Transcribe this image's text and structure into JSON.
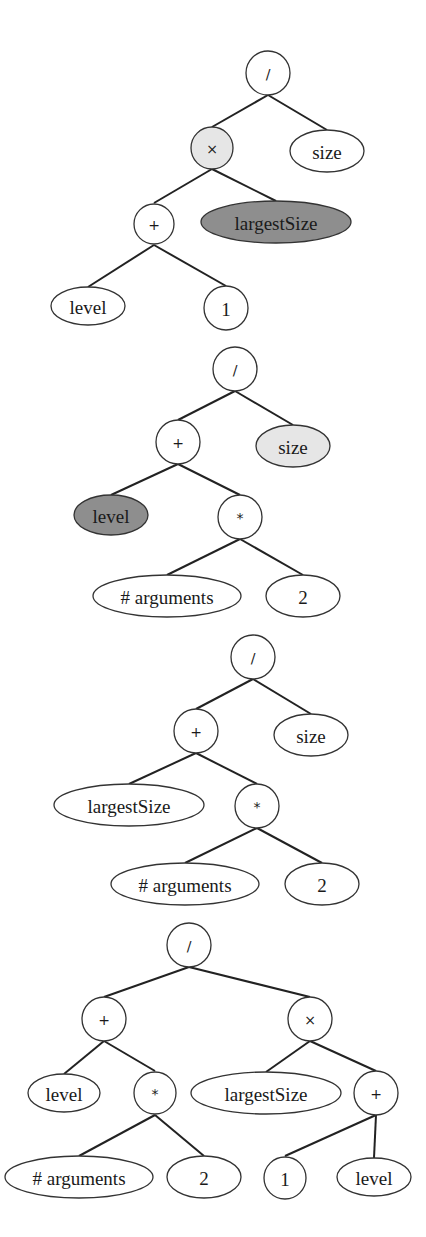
{
  "colors": {
    "none": "#ffffff",
    "light": "#e6e6e6",
    "dark": "#8e8e8e"
  },
  "trees": [
    {
      "name": "tree-1",
      "nodes": [
        {
          "id": "t1-div",
          "label": "/",
          "shape": "circle",
          "fill": "none"
        },
        {
          "id": "t1-times",
          "label": "×",
          "shape": "circle",
          "fill": "light"
        },
        {
          "id": "t1-size",
          "label": "size",
          "shape": "ellipse",
          "fill": "none"
        },
        {
          "id": "t1-plus",
          "label": "+",
          "shape": "circle",
          "fill": "none"
        },
        {
          "id": "t1-largestSize",
          "label": "largestSize",
          "shape": "ellipse",
          "fill": "dark"
        },
        {
          "id": "t1-level",
          "label": "level",
          "shape": "ellipse",
          "fill": "none"
        },
        {
          "id": "t1-one",
          "label": "1",
          "shape": "circle",
          "fill": "none"
        }
      ],
      "edges": [
        [
          "t1-div",
          "t1-times"
        ],
        [
          "t1-div",
          "t1-size"
        ],
        [
          "t1-times",
          "t1-plus"
        ],
        [
          "t1-times",
          "t1-largestSize"
        ],
        [
          "t1-plus",
          "t1-level"
        ],
        [
          "t1-plus",
          "t1-one"
        ]
      ]
    },
    {
      "name": "tree-2",
      "nodes": [
        {
          "id": "t2-div",
          "label": "/",
          "shape": "circle",
          "fill": "none"
        },
        {
          "id": "t2-plus",
          "label": "+",
          "shape": "circle",
          "fill": "none"
        },
        {
          "id": "t2-size",
          "label": "size",
          "shape": "ellipse",
          "fill": "light"
        },
        {
          "id": "t2-level",
          "label": "level",
          "shape": "ellipse",
          "fill": "dark"
        },
        {
          "id": "t2-mul",
          "label": "*",
          "shape": "circle",
          "fill": "none"
        },
        {
          "id": "t2-args",
          "label": "# arguments",
          "shape": "ellipse",
          "fill": "none"
        },
        {
          "id": "t2-two",
          "label": "2",
          "shape": "ellipse",
          "fill": "none"
        }
      ],
      "edges": [
        [
          "t2-div",
          "t2-plus"
        ],
        [
          "t2-div",
          "t2-size"
        ],
        [
          "t2-plus",
          "t2-level"
        ],
        [
          "t2-plus",
          "t2-mul"
        ],
        [
          "t2-mul",
          "t2-args"
        ],
        [
          "t2-mul",
          "t2-two"
        ]
      ]
    },
    {
      "name": "tree-3",
      "nodes": [
        {
          "id": "t3-div",
          "label": "/",
          "shape": "circle",
          "fill": "none"
        },
        {
          "id": "t3-plus",
          "label": "+",
          "shape": "circle",
          "fill": "none"
        },
        {
          "id": "t3-size",
          "label": "size",
          "shape": "ellipse",
          "fill": "none"
        },
        {
          "id": "t3-largestSize",
          "label": "largestSize",
          "shape": "ellipse",
          "fill": "none"
        },
        {
          "id": "t3-mul",
          "label": "*",
          "shape": "circle",
          "fill": "none"
        },
        {
          "id": "t3-args",
          "label": "# arguments",
          "shape": "ellipse",
          "fill": "none"
        },
        {
          "id": "t3-two",
          "label": "2",
          "shape": "ellipse",
          "fill": "none"
        }
      ],
      "edges": [
        [
          "t3-div",
          "t3-plus"
        ],
        [
          "t3-div",
          "t3-size"
        ],
        [
          "t3-plus",
          "t3-largestSize"
        ],
        [
          "t3-plus",
          "t3-mul"
        ],
        [
          "t3-mul",
          "t3-args"
        ],
        [
          "t3-mul",
          "t3-two"
        ]
      ]
    },
    {
      "name": "tree-4",
      "nodes": [
        {
          "id": "t4-div",
          "label": "/",
          "shape": "circle",
          "fill": "none"
        },
        {
          "id": "t4-plus",
          "label": "+",
          "shape": "circle",
          "fill": "none"
        },
        {
          "id": "t4-times",
          "label": "×",
          "shape": "circle",
          "fill": "none"
        },
        {
          "id": "t4-level",
          "label": "level",
          "shape": "ellipse",
          "fill": "none"
        },
        {
          "id": "t4-mul",
          "label": "*",
          "shape": "circle",
          "fill": "none"
        },
        {
          "id": "t4-largestSize",
          "label": "largestSize",
          "shape": "ellipse",
          "fill": "none"
        },
        {
          "id": "t4-plus2",
          "label": "+",
          "shape": "circle",
          "fill": "none"
        },
        {
          "id": "t4-args",
          "label": "# arguments",
          "shape": "ellipse",
          "fill": "none"
        },
        {
          "id": "t4-two",
          "label": "2",
          "shape": "ellipse",
          "fill": "none"
        },
        {
          "id": "t4-one",
          "label": "1",
          "shape": "circle",
          "fill": "none"
        },
        {
          "id": "t4-level2",
          "label": "level",
          "shape": "ellipse",
          "fill": "none"
        }
      ],
      "edges": [
        [
          "t4-div",
          "t4-plus"
        ],
        [
          "t4-div",
          "t4-times"
        ],
        [
          "t4-plus",
          "t4-level"
        ],
        [
          "t4-plus",
          "t4-mul"
        ],
        [
          "t4-mul",
          "t4-args"
        ],
        [
          "t4-mul",
          "t4-two"
        ],
        [
          "t4-times",
          "t4-largestSize"
        ],
        [
          "t4-times",
          "t4-plus2"
        ],
        [
          "t4-plus2",
          "t4-one"
        ],
        [
          "t4-plus2",
          "t4-level2"
        ]
      ]
    }
  ]
}
